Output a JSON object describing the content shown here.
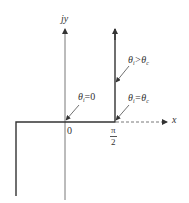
{
  "diagram": {
    "type": "complex-plane contour",
    "axes": {
      "horizontal_label": "x",
      "vertical_label": "jy",
      "origin_label": "0",
      "tick_label": {
        "numerator": "π",
        "denominator": "2"
      }
    },
    "annotations": [
      {
        "id": "theta-zero",
        "text_prefix": "θ",
        "sub": "i",
        "text_suffix": "=0"
      },
      {
        "id": "theta-critical",
        "text_prefix": "θ",
        "sub": "i",
        "text_suffix": "=θ",
        "sub2": "c"
      },
      {
        "id": "theta-greater",
        "text_prefix": "θ",
        "sub": "i",
        "text_suffix": ">θ",
        "sub2": "c"
      }
    ],
    "colors": {
      "line": "#444444",
      "path": "#333333",
      "text": "#333333"
    }
  }
}
